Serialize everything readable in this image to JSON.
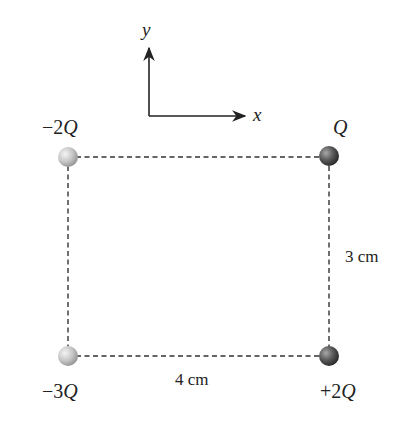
{
  "axes": {
    "x_label": "x",
    "y_label": "y",
    "origin": [
      149,
      116
    ],
    "x_end": [
      247,
      116
    ],
    "y_end": [
      149,
      46
    ]
  },
  "charges": [
    {
      "id": "top-left",
      "label_sign": "−2",
      "label_var": "Q",
      "cx": 68,
      "cy": 157,
      "color": "light",
      "label_x": 50,
      "label_y": 128
    },
    {
      "id": "top-right",
      "label_sign": "",
      "label_var": "Q",
      "cx": 329,
      "cy": 156,
      "color": "dark",
      "label_x": 330,
      "label_y": 128
    },
    {
      "id": "bottom-left",
      "label_sign": "−3",
      "label_var": "Q",
      "cx": 68,
      "cy": 356,
      "color": "light",
      "label_x": 50,
      "label_y": 398
    },
    {
      "id": "bottom-right",
      "label_sign": "+2",
      "label_var": "Q",
      "cx": 329,
      "cy": 356,
      "color": "dark",
      "label_x": 332,
      "label_y": 398
    }
  ],
  "dimensions": {
    "vertical": "3 cm",
    "horizontal": "4 cm"
  },
  "colors": {
    "line": "#333333",
    "light_charge": "#c8c8c8",
    "dark_charge": "#555555"
  }
}
